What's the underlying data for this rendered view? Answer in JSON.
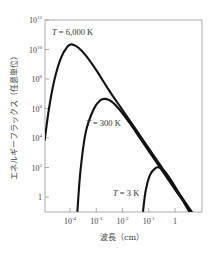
{
  "chart_data": {
    "type": "line",
    "title": "",
    "xlabel": "波長（cm）",
    "ylabel": "エネルギーフラックス（任意単位）",
    "xscale": "log",
    "yscale": "log",
    "x_ticks": [
      {
        "exp": "-4",
        "base": "10",
        "value": 0.0001
      },
      {
        "exp": "-3",
        "base": "10",
        "value": 0.001
      },
      {
        "exp": "-2",
        "base": "10",
        "value": 0.01
      },
      {
        "exp": "-1",
        "base": "10",
        "value": 0.1
      },
      {
        "exp": "",
        "base": "1",
        "value": 1
      }
    ],
    "y_ticks": [
      {
        "exp": "12",
        "base": "10",
        "value": 1000000000000.0
      },
      {
        "exp": "10",
        "base": "10",
        "value": 10000000000.0
      },
      {
        "exp": "8",
        "base": "10",
        "value": 100000000.0
      },
      {
        "exp": "6",
        "base": "10",
        "value": 1000000.0
      },
      {
        "exp": "4",
        "base": "10",
        "value": 10000.0
      },
      {
        "exp": "2",
        "base": "10",
        "value": 100.0
      },
      {
        "exp": "",
        "base": "1",
        "value": 1
      }
    ],
    "xlim_log10": [
      -5.0,
      1.05
    ],
    "ylim_log10": [
      -1.0,
      12
    ],
    "grid": false,
    "legend": "none (inline labels)",
    "series": [
      {
        "name": "T = 6,000 K",
        "label_T": "T",
        "label_rest": " = 6,000 K",
        "label_pos": [
          52,
          35
        ],
        "points_log10": [
          [
            -4.97,
            3.8
          ],
          [
            -4.8,
            6.0
          ],
          [
            -4.6,
            7.9
          ],
          [
            -4.35,
            9.4
          ],
          [
            -4.1,
            10.2
          ],
          [
            -3.93,
            10.35
          ],
          [
            -3.7,
            10.15
          ],
          [
            -3.4,
            9.6
          ],
          [
            -3.0,
            8.6
          ],
          [
            -2.5,
            7.2
          ],
          [
            -2.0,
            5.9
          ],
          [
            -1.5,
            4.6
          ],
          [
            -1.0,
            3.3
          ],
          [
            -0.5,
            2.0
          ],
          [
            0.0,
            0.65
          ],
          [
            0.5,
            -0.65
          ],
          [
            1.02,
            -2.0
          ]
        ]
      },
      {
        "name": "T = 300 K",
        "label_T": "T",
        "label_rest": " = 300 K",
        "label_pos": [
          86,
          126
        ],
        "points_log10": [
          [
            -3.72,
            -1.0
          ],
          [
            -3.6,
            1.8
          ],
          [
            -3.4,
            4.4
          ],
          [
            -3.1,
            5.95
          ],
          [
            -2.85,
            6.55
          ],
          [
            -2.65,
            6.65
          ],
          [
            -2.4,
            6.45
          ],
          [
            -2.1,
            5.9
          ],
          [
            -1.7,
            4.95
          ],
          [
            -1.3,
            3.9
          ],
          [
            -0.8,
            2.6
          ],
          [
            -0.3,
            1.3
          ],
          [
            0.2,
            0.0
          ],
          [
            0.6,
            -1.0
          ],
          [
            1.02,
            -2.2
          ]
        ]
      },
      {
        "name": "T = 3 K",
        "label_T": "T",
        "label_rest": " = 3 K",
        "label_pos": [
          113,
          196
        ],
        "points_log10": [
          [
            -1.22,
            -1.0
          ],
          [
            -1.12,
            0.4
          ],
          [
            -0.95,
            1.5
          ],
          [
            -0.75,
            1.95
          ],
          [
            -0.6,
            2.0
          ],
          [
            -0.4,
            1.75
          ],
          [
            -0.1,
            1.0
          ],
          [
            0.2,
            0.1
          ],
          [
            0.4,
            -0.55
          ],
          [
            0.55,
            -1.0
          ]
        ]
      }
    ]
  },
  "axes": {
    "x_title": "波長（cm）",
    "y_title": "エネルギーフラックス（任意単位）"
  }
}
